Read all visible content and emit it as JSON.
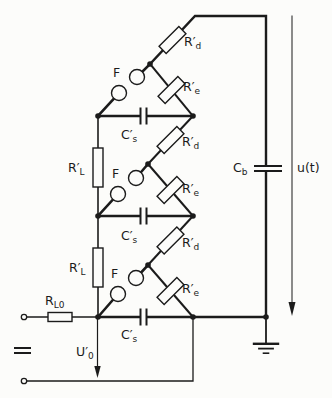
{
  "colors": {
    "ink": "#1b1b1b",
    "background": "#fcfcfa"
  },
  "labels": {
    "spark_gap": "F",
    "rd": {
      "main": "R′",
      "sub": "d"
    },
    "re": {
      "main": "R′",
      "sub": "e"
    },
    "rl": {
      "main": "R′",
      "sub": "L"
    },
    "rl0": {
      "main": "R",
      "sub": "L0"
    },
    "cs": {
      "main": "C′",
      "sub": "s"
    },
    "cb": {
      "main": "C",
      "sub": "b"
    },
    "u0": {
      "main": "U′",
      "sub": "0"
    },
    "ut": "u(t)"
  }
}
